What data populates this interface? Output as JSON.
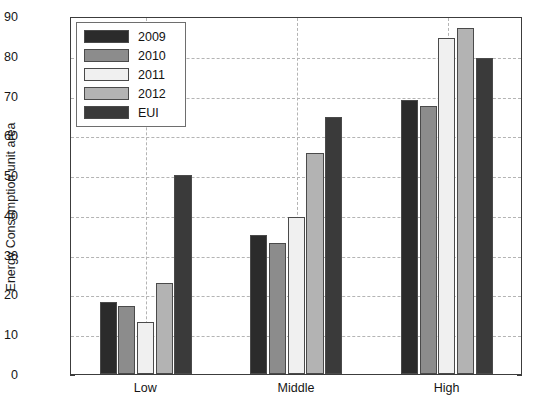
{
  "chart_data": {
    "type": "bar",
    "title": "",
    "xlabel": "",
    "ylabel": "Energy Consumption unit area",
    "categories": [
      "Low",
      "Middle",
      "High"
    ],
    "ylim": [
      0,
      90
    ],
    "ytick_step": 10,
    "yticks": [
      0,
      10,
      20,
      30,
      40,
      50,
      60,
      70,
      80,
      90
    ],
    "ytick_labels": [
      "0",
      "10",
      "20",
      "30",
      "40",
      "50",
      "60",
      "70",
      "80",
      "90"
    ],
    "grid": true,
    "grid_style": "dashed",
    "legend_position": "upper left",
    "series": [
      {
        "name": "2009",
        "color": "#2b2b2b",
        "values": [
          18,
          35,
          69
        ]
      },
      {
        "name": "2010",
        "color": "#8c8c8c",
        "values": [
          17,
          33,
          67.5
        ]
      },
      {
        "name": "2011",
        "color": "#f0f0f0",
        "values": [
          13,
          39.5,
          84.5
        ]
      },
      {
        "name": "2012",
        "color": "#b3b3b3",
        "values": [
          23,
          55.5,
          87
        ]
      },
      {
        "name": "EUI",
        "color": "#3a3a3a",
        "values": [
          50,
          64.5,
          79.5
        ]
      }
    ]
  }
}
